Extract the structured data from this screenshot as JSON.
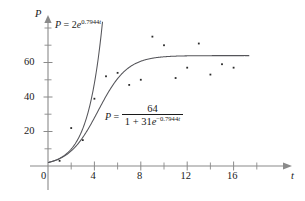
{
  "chart_data": {
    "type": "scatter",
    "title": "",
    "xlabel": "t",
    "ylabel": "P",
    "xlim": [
      0,
      17.4
    ],
    "ylim": [
      0,
      80
    ],
    "grid": false,
    "legend": "none",
    "x_ticks_major": [
      0,
      4,
      8,
      12,
      16
    ],
    "x_ticks_minor": [
      2,
      6,
      10,
      14
    ],
    "x_tick_labels": [
      "0",
      "4",
      "8",
      "12",
      "16"
    ],
    "y_ticks_major": [
      20,
      40,
      60
    ],
    "y_ticks_minor": [
      10,
      30,
      50,
      70
    ],
    "y_tick_labels": [
      "20",
      "40",
      "60"
    ],
    "scatter": {
      "name": "observed data",
      "points": [
        {
          "x": 1,
          "y": 3
        },
        {
          "x": 2,
          "y": 22
        },
        {
          "x": 3,
          "y": 15
        },
        {
          "x": 4,
          "y": 39
        },
        {
          "x": 5,
          "y": 52
        },
        {
          "x": 6,
          "y": 54
        },
        {
          "x": 7,
          "y": 47
        },
        {
          "x": 8,
          "y": 50
        },
        {
          "x": 9,
          "y": 75
        },
        {
          "x": 10,
          "y": 70
        },
        {
          "x": 11,
          "y": 51
        },
        {
          "x": 12,
          "y": 57
        },
        {
          "x": 13,
          "y": 71
        },
        {
          "x": 14,
          "y": 53
        },
        {
          "x": 15,
          "y": 59
        },
        {
          "x": 16,
          "y": 57
        }
      ]
    },
    "series": [
      {
        "name": "exponential model",
        "kind": "line",
        "model": "exponential",
        "a": 2,
        "k": 0.7944,
        "label_text": "P = 2e^0.7944t"
      },
      {
        "name": "logistic model",
        "kind": "line",
        "model": "logistic",
        "carrying_capacity": 64,
        "a": 31,
        "k": 0.7944,
        "label_text": "P = 64 / (1 + 31e^-0.7944t)"
      }
    ]
  },
  "annotations": {
    "exponential": {
      "P": "P",
      "equals": "=",
      "coefficient": "2",
      "base": "e",
      "exponent_coefficient": "0.7944",
      "exponent_variable": "t"
    },
    "logistic": {
      "P": "P",
      "equals": "=",
      "numerator": "64",
      "denominator_lead": "1 + 31",
      "denominator_base": "e",
      "denominator_exponent": "−0.7944",
      "denominator_exponent_variable": "t"
    }
  },
  "axes": {
    "y_name": "P",
    "x_name": "t"
  },
  "colors": {
    "curve": "#55555a",
    "axis": "#8a8a8a",
    "point": "#2b2b2b",
    "text": "#1a1a1a",
    "background": "#ffffff"
  }
}
